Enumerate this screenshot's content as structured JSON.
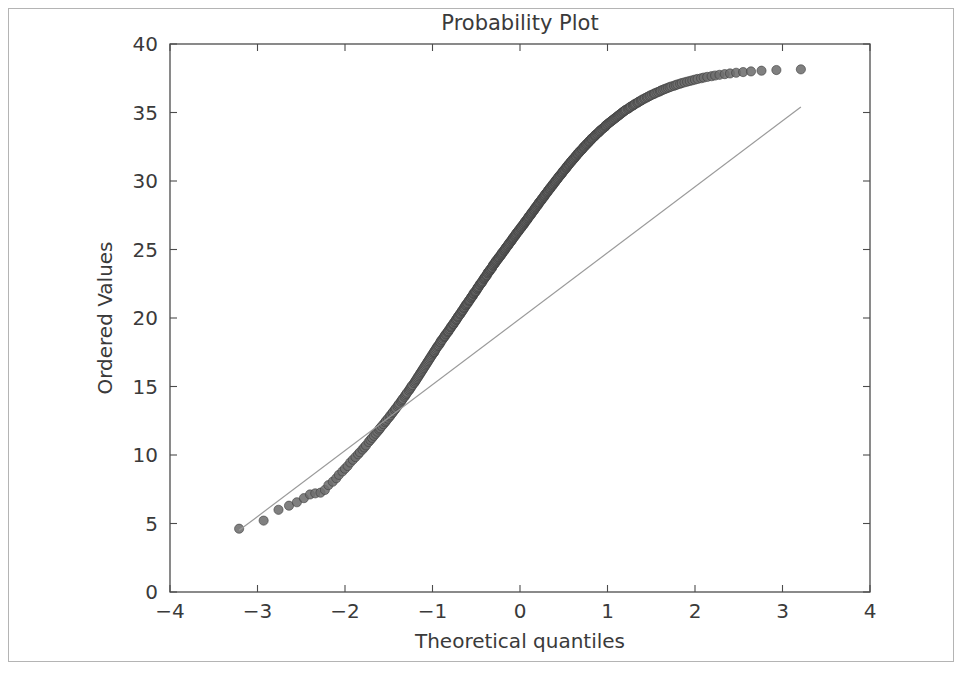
{
  "figure": {
    "width": 976,
    "height": 677,
    "background": "#ffffff",
    "border_color": "#b4b4b4"
  },
  "chart_data": {
    "type": "scatter",
    "title": "Probability Plot",
    "xlabel": "Theoretical quantiles",
    "ylabel": "Ordered Values",
    "xlim": [
      -4,
      4
    ],
    "ylim": [
      0,
      40
    ],
    "xticks": [
      -4,
      -3,
      -2,
      -1,
      0,
      1,
      2,
      3,
      4
    ],
    "xtick_labels": [
      "−4",
      "−3",
      "−2",
      "−1",
      "0",
      "1",
      "2",
      "3",
      "4"
    ],
    "yticks": [
      0,
      5,
      10,
      15,
      20,
      25,
      30,
      35,
      40
    ],
    "ytick_labels": [
      "0",
      "5",
      "10",
      "15",
      "20",
      "25",
      "30",
      "35",
      "40"
    ],
    "grid": false,
    "legend": null,
    "marker_color": "#6e6e6e",
    "marker_edge_color": "#3b3b3b",
    "marker_radius": 4.6,
    "n_points": 497,
    "series": [
      {
        "name": "ordered sample quantiles",
        "marker": "circle",
        "x": [
          -3.21,
          -2.93,
          -2.76,
          -2.64,
          -2.55,
          -2.47,
          -2.4,
          -2.34,
          -2.28,
          -2.23,
          -2.19,
          -2.14,
          -2.1,
          -2.07,
          -2.03,
          -2.0,
          -1.97,
          -1.94,
          -1.91,
          -1.88,
          -1.85,
          -1.83,
          -1.8,
          -1.78,
          -1.76,
          -1.73,
          -1.71,
          -1.69,
          -1.67,
          -1.65,
          -1.63,
          -1.61,
          -1.6,
          -1.58,
          -1.56,
          -1.54,
          -1.53,
          -1.51,
          -1.49,
          -1.48,
          -1.46,
          -1.45,
          -1.43,
          -1.42,
          -1.4,
          -1.39,
          -1.38,
          -1.36,
          -1.35,
          -1.34,
          -1.32,
          -1.31,
          -1.3,
          -1.29,
          -1.27,
          -1.26,
          -1.25,
          -1.24,
          -1.23,
          -1.21,
          -1.2,
          -1.19,
          -1.18,
          -1.17,
          -1.16,
          -1.15,
          -1.14,
          -1.13,
          -1.12,
          -1.11,
          -1.1,
          -1.09,
          -1.08,
          -1.07,
          -1.06,
          -1.05,
          -1.04,
          -1.03,
          -1.02,
          -1.01,
          -1.0,
          -0.99,
          -0.98,
          -0.98,
          -0.97,
          -0.96,
          -0.95,
          -0.94,
          -0.93,
          -0.92,
          -0.91,
          -0.91,
          -0.9,
          -0.89,
          -0.88,
          -0.87,
          -0.86,
          -0.86,
          -0.85,
          -0.84,
          -0.83,
          -0.82,
          -0.82,
          -0.81,
          -0.8,
          -0.79,
          -0.79,
          -0.78,
          -0.77,
          -0.76,
          -0.76,
          -0.75,
          -0.74,
          -0.73,
          -0.73,
          -0.72,
          -0.71,
          -0.71,
          -0.7,
          -0.69,
          -0.68,
          -0.68,
          -0.67,
          -0.66,
          -0.66,
          -0.65,
          -0.64,
          -0.64,
          -0.63,
          -0.62,
          -0.62,
          -0.61,
          -0.6,
          -0.6,
          -0.59,
          -0.58,
          -0.58,
          -0.57,
          -0.56,
          -0.56,
          -0.55,
          -0.54,
          -0.54,
          -0.53,
          -0.53,
          -0.52,
          -0.51,
          -0.51,
          -0.5,
          -0.49,
          -0.49,
          -0.48,
          -0.48,
          -0.47,
          -0.46,
          -0.46,
          -0.45,
          -0.44,
          -0.44,
          -0.43,
          -0.43,
          -0.42,
          -0.41,
          -0.41,
          -0.4,
          -0.4,
          -0.39,
          -0.38,
          -0.38,
          -0.37,
          -0.37,
          -0.36,
          -0.35,
          -0.35,
          -0.34,
          -0.34,
          -0.33,
          -0.32,
          -0.32,
          -0.31,
          -0.31,
          -0.3,
          -0.29,
          -0.29,
          -0.28,
          -0.28,
          -0.27,
          -0.27,
          -0.26,
          -0.25,
          -0.25,
          -0.24,
          -0.24,
          -0.23,
          -0.22,
          -0.22,
          -0.21,
          -0.21,
          -0.2,
          -0.2,
          -0.19,
          -0.18,
          -0.18,
          -0.17,
          -0.17,
          -0.16,
          -0.16,
          -0.15,
          -0.14,
          -0.14,
          -0.13,
          -0.13,
          -0.12,
          -0.12,
          -0.11,
          -0.1,
          -0.1,
          -0.09,
          -0.09,
          -0.08,
          -0.08,
          -0.07,
          -0.06,
          -0.06,
          -0.05,
          -0.05,
          -0.04,
          -0.04,
          -0.03,
          -0.02,
          -0.02,
          -0.01,
          -0.01,
          0.0,
          0.01,
          0.01,
          0.02,
          0.02,
          0.03,
          0.04,
          0.04,
          0.05,
          0.05,
          0.06,
          0.06,
          0.07,
          0.08,
          0.08,
          0.09,
          0.09,
          0.1,
          0.1,
          0.11,
          0.12,
          0.12,
          0.13,
          0.13,
          0.14,
          0.14,
          0.15,
          0.16,
          0.16,
          0.17,
          0.17,
          0.18,
          0.18,
          0.19,
          0.2,
          0.2,
          0.21,
          0.21,
          0.22,
          0.22,
          0.23,
          0.24,
          0.24,
          0.25,
          0.25,
          0.26,
          0.27,
          0.27,
          0.28,
          0.28,
          0.29,
          0.29,
          0.3,
          0.31,
          0.31,
          0.32,
          0.32,
          0.33,
          0.34,
          0.34,
          0.35,
          0.35,
          0.36,
          0.37,
          0.37,
          0.38,
          0.38,
          0.39,
          0.4,
          0.4,
          0.41,
          0.41,
          0.42,
          0.43,
          0.43,
          0.44,
          0.44,
          0.45,
          0.46,
          0.46,
          0.47,
          0.48,
          0.48,
          0.49,
          0.49,
          0.5,
          0.51,
          0.51,
          0.52,
          0.53,
          0.53,
          0.54,
          0.54,
          0.55,
          0.56,
          0.56,
          0.57,
          0.58,
          0.58,
          0.59,
          0.6,
          0.6,
          0.61,
          0.62,
          0.62,
          0.63,
          0.64,
          0.64,
          0.65,
          0.66,
          0.66,
          0.67,
          0.68,
          0.68,
          0.69,
          0.7,
          0.71,
          0.71,
          0.72,
          0.73,
          0.73,
          0.74,
          0.75,
          0.76,
          0.76,
          0.77,
          0.78,
          0.79,
          0.79,
          0.8,
          0.81,
          0.82,
          0.82,
          0.83,
          0.84,
          0.85,
          0.86,
          0.86,
          0.87,
          0.88,
          0.89,
          0.9,
          0.91,
          0.91,
          0.92,
          0.93,
          0.94,
          0.95,
          0.96,
          0.97,
          0.98,
          0.98,
          0.99,
          1.0,
          1.01,
          1.02,
          1.03,
          1.04,
          1.05,
          1.06,
          1.07,
          1.08,
          1.09,
          1.1,
          1.11,
          1.12,
          1.13,
          1.14,
          1.15,
          1.16,
          1.17,
          1.18,
          1.19,
          1.2,
          1.21,
          1.23,
          1.24,
          1.25,
          1.26,
          1.27,
          1.29,
          1.3,
          1.31,
          1.32,
          1.34,
          1.35,
          1.36,
          1.38,
          1.39,
          1.4,
          1.42,
          1.43,
          1.45,
          1.46,
          1.48,
          1.49,
          1.51,
          1.53,
          1.54,
          1.56,
          1.58,
          1.6,
          1.61,
          1.63,
          1.65,
          1.67,
          1.69,
          1.71,
          1.73,
          1.76,
          1.78,
          1.8,
          1.83,
          1.85,
          1.88,
          1.91,
          1.94,
          1.97,
          2.0,
          2.03,
          2.07,
          2.1,
          2.14,
          2.19,
          2.23,
          2.28,
          2.34,
          2.4,
          2.47,
          2.55,
          2.64,
          2.76,
          2.93,
          3.21
        ],
        "y": [
          4.62,
          5.21,
          6.0,
          6.3,
          6.55,
          6.85,
          7.12,
          7.2,
          7.25,
          7.45,
          7.8,
          8.05,
          8.3,
          8.55,
          8.8,
          9.0,
          9.2,
          9.45,
          9.65,
          9.85,
          10.05,
          10.2,
          10.4,
          10.55,
          10.7,
          10.95,
          11.1,
          11.25,
          11.4,
          11.55,
          11.7,
          11.85,
          11.95,
          12.1,
          12.25,
          12.4,
          12.5,
          12.65,
          12.8,
          12.9,
          13.05,
          13.15,
          13.3,
          13.4,
          13.55,
          13.65,
          13.75,
          13.9,
          14.0,
          14.1,
          14.25,
          14.35,
          14.45,
          14.55,
          14.7,
          14.8,
          14.9,
          15.0,
          15.1,
          15.25,
          15.35,
          15.45,
          15.55,
          15.65,
          15.75,
          15.85,
          15.95,
          16.05,
          16.15,
          16.25,
          16.35,
          16.45,
          16.55,
          16.65,
          16.75,
          16.85,
          16.95,
          17.05,
          17.15,
          17.25,
          17.35,
          17.45,
          17.5,
          17.55,
          17.65,
          17.75,
          17.85,
          17.95,
          18.0,
          18.1,
          18.2,
          18.25,
          18.35,
          18.4,
          18.5,
          18.6,
          18.65,
          18.7,
          18.8,
          18.85,
          18.95,
          19.0,
          19.05,
          19.15,
          19.2,
          19.3,
          19.35,
          19.4,
          19.5,
          19.55,
          19.6,
          19.7,
          19.75,
          19.85,
          19.9,
          19.95,
          20.05,
          20.1,
          20.15,
          20.25,
          20.3,
          20.35,
          20.45,
          20.5,
          20.55,
          20.6,
          20.7,
          20.75,
          20.8,
          20.9,
          20.95,
          21.0,
          21.05,
          21.1,
          21.2,
          21.25,
          21.3,
          21.35,
          21.45,
          21.5,
          21.55,
          21.6,
          21.65,
          21.75,
          21.8,
          21.85,
          21.9,
          21.95,
          22.0,
          22.1,
          22.15,
          22.2,
          22.25,
          22.3,
          22.4,
          22.45,
          22.5,
          22.55,
          22.6,
          22.65,
          22.7,
          22.8,
          22.85,
          22.9,
          22.95,
          23.0,
          23.05,
          23.1,
          23.15,
          23.25,
          23.3,
          23.35,
          23.4,
          23.45,
          23.5,
          23.55,
          23.6,
          23.65,
          23.7,
          23.8,
          23.85,
          23.9,
          23.95,
          24.0,
          24.05,
          24.1,
          24.15,
          24.2,
          24.25,
          24.3,
          24.35,
          24.4,
          24.45,
          24.5,
          24.55,
          24.6,
          24.65,
          24.7,
          24.75,
          24.8,
          24.85,
          24.9,
          24.95,
          25.0,
          25.05,
          25.1,
          25.15,
          25.2,
          25.25,
          25.3,
          25.35,
          25.4,
          25.45,
          25.5,
          25.55,
          25.6,
          25.65,
          25.7,
          25.75,
          25.8,
          25.85,
          25.9,
          25.95,
          26.0,
          26.05,
          26.1,
          26.15,
          26.2,
          26.25,
          26.3,
          26.35,
          26.4,
          26.45,
          26.5,
          26.55,
          26.6,
          26.65,
          26.7,
          26.75,
          26.8,
          26.85,
          26.9,
          26.95,
          27.0,
          27.05,
          27.1,
          27.15,
          27.2,
          27.25,
          27.3,
          27.35,
          27.4,
          27.45,
          27.5,
          27.55,
          27.6,
          27.65,
          27.7,
          27.75,
          27.8,
          27.85,
          27.9,
          27.95,
          28.0,
          28.05,
          28.1,
          28.15,
          28.2,
          28.25,
          28.3,
          28.35,
          28.4,
          28.45,
          28.5,
          28.55,
          28.6,
          28.65,
          28.7,
          28.75,
          28.8,
          28.85,
          28.9,
          28.95,
          29.0,
          29.05,
          29.1,
          29.15,
          29.2,
          29.25,
          29.3,
          29.35,
          29.4,
          29.45,
          29.5,
          29.55,
          29.6,
          29.65,
          29.7,
          29.75,
          29.8,
          29.85,
          29.9,
          29.95,
          30.0,
          30.05,
          30.1,
          30.15,
          30.2,
          30.25,
          30.3,
          30.35,
          30.4,
          30.45,
          30.5,
          30.55,
          30.6,
          30.65,
          30.7,
          30.75,
          30.8,
          30.85,
          30.9,
          30.95,
          31.0,
          31.05,
          31.1,
          31.15,
          31.2,
          31.25,
          31.3,
          31.35,
          31.4,
          31.45,
          31.5,
          31.55,
          31.6,
          31.65,
          31.7,
          31.75,
          31.8,
          31.85,
          31.9,
          31.95,
          32.0,
          32.05,
          32.1,
          32.15,
          32.2,
          32.25,
          32.3,
          32.35,
          32.4,
          32.45,
          32.5,
          32.55,
          32.6,
          32.65,
          32.7,
          32.75,
          32.8,
          32.85,
          32.9,
          32.95,
          33.0,
          33.05,
          33.1,
          33.15,
          33.2,
          33.25,
          33.3,
          33.35,
          33.4,
          33.45,
          33.5,
          33.55,
          33.6,
          33.65,
          33.7,
          33.75,
          33.8,
          33.85,
          33.9,
          33.95,
          34.0,
          34.05,
          34.1,
          34.15,
          34.2,
          34.25,
          34.3,
          34.35,
          34.4,
          34.45,
          34.5,
          34.55,
          34.6,
          34.65,
          34.7,
          34.75,
          34.8,
          34.85,
          34.9,
          34.95,
          35.0,
          35.05,
          35.1,
          35.15,
          35.2,
          35.25,
          35.3,
          35.35,
          35.4,
          35.45,
          35.5,
          35.55,
          35.6,
          35.65,
          35.7,
          35.75,
          35.8,
          35.85,
          35.9,
          35.95,
          36.0,
          36.05,
          36.1,
          36.15,
          36.2,
          36.25,
          36.3,
          36.35,
          36.4,
          36.45,
          36.5,
          36.55,
          36.6,
          36.65,
          36.7,
          36.75,
          36.8,
          36.85,
          36.9,
          36.95,
          37.0,
          37.05,
          37.1,
          37.15,
          37.2,
          37.25,
          37.3,
          37.35,
          37.4,
          37.45,
          37.5,
          37.55,
          37.6,
          37.65,
          37.7,
          37.75,
          37.8,
          37.85,
          37.9,
          37.95,
          38.0,
          38.05,
          38.1,
          38.15
        ]
      }
    ],
    "fit_line": {
      "name": "least-squares reference line",
      "color": "#9a9a9a",
      "x": [
        -3.21,
        3.21
      ],
      "y": [
        4.5,
        35.4
      ]
    }
  }
}
